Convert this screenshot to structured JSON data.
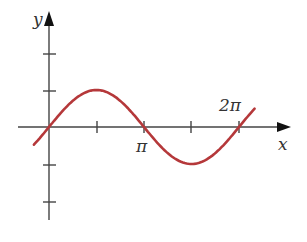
{
  "chart_data": {
    "type": "line",
    "title": "",
    "function": "y = sin(x)",
    "xlabel": "x",
    "ylabel": "y",
    "x_ticks": [
      "",
      "π",
      "",
      "2π"
    ],
    "x_tick_values": [
      1.5708,
      3.1416,
      4.7124,
      6.2832
    ],
    "y_tick_values": [
      2,
      1,
      -1,
      -2
    ],
    "xlim": [
      -0.3,
      6.9
    ],
    "ylim": [
      -2.3,
      3.1
    ],
    "series": [
      {
        "name": "sin(x)",
        "color": "#b5383a",
        "x": [
          -0.5,
          0,
          0.785,
          1.571,
          2.356,
          3.142,
          3.927,
          4.712,
          5.498,
          6.283,
          6.8
        ],
        "values": [
          -0.479,
          0,
          0.707,
          1,
          0.707,
          0,
          -0.707,
          -1,
          -0.707,
          0,
          0.494
        ]
      }
    ],
    "grid": false,
    "legend": "none"
  },
  "labels": {
    "x_axis": "x",
    "y_axis": "y",
    "pi": "π",
    "two_pi": "2π"
  },
  "colors": {
    "curve": "#b5383a",
    "axis": "#444444"
  }
}
